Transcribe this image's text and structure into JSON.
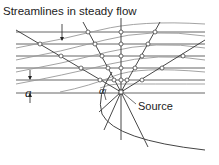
{
  "diagram": {
    "title": "Streamlines in steady flow",
    "labels": {
      "source": "Source",
      "spacing": "a",
      "angle": "α"
    },
    "colors": {
      "uniform_streamline": "#555555",
      "curved_streamline": "#999999",
      "radial_line": "#333333",
      "boundary": "#444444",
      "node_fill": "#ffffff",
      "text": "#222222"
    },
    "elements": {
      "uniform_streamlines_count": 6,
      "radial_lines_from_source": true,
      "boundary_shape": "half-body (parabola-like)"
    }
  }
}
